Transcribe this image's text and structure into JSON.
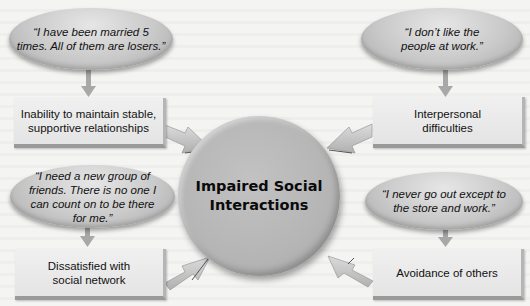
{
  "diagram": {
    "center": {
      "label": "Impaired Social Interactions",
      "line1": "Impaired Social",
      "line2": "Interactions"
    },
    "nodes": [
      {
        "id": "top-left",
        "quote_lines": [
          "“I have been married 5",
          "times. All of them are losers.”"
        ],
        "box_lines": [
          "Inability to maintain stable,",
          "supportive relationships"
        ]
      },
      {
        "id": "top-right",
        "quote_lines": [
          "“I don’t like the",
          "people at work.”"
        ],
        "box_lines": [
          "Interpersonal",
          "difficulties"
        ]
      },
      {
        "id": "bottom-left",
        "quote_lines": [
          "“I need a new group of",
          "friends. There is no one I",
          "can count on to be there",
          "for me.”"
        ],
        "box_lines": [
          "Dissatisfied with",
          "social network"
        ]
      },
      {
        "id": "bottom-right",
        "quote_lines": [
          "“I never go out except to",
          "the store and work.”"
        ],
        "box_lines": [
          "Avoidance of others"
        ]
      }
    ],
    "colors": {
      "background": "#f4f4f3",
      "ellipse": "#c9c9c9",
      "box": "#e8e8e8",
      "circle": "#b5b5b5",
      "arrow": "#c8c8c8"
    }
  }
}
